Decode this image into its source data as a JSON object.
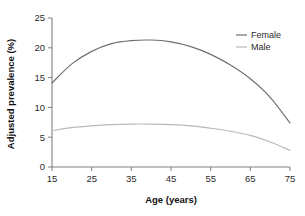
{
  "chart_data": {
    "type": "line",
    "title": "",
    "xlabel": "Age (years)",
    "ylabel": "Adjusted prevalence (%)",
    "xlim": [
      15,
      75
    ],
    "ylim": [
      0,
      25
    ],
    "xticks": [
      15,
      25,
      35,
      45,
      55,
      65,
      75
    ],
    "yticks": [
      0,
      5,
      10,
      15,
      20,
      25
    ],
    "xtick_labels": [
      "15",
      "25",
      "35",
      "45",
      "55",
      "65",
      "75"
    ],
    "ytick_labels": [
      "0",
      "5",
      "10",
      "15",
      "20",
      "25"
    ],
    "grid": false,
    "legend_position": "top-right",
    "x": [
      15,
      20,
      25,
      30,
      35,
      40,
      45,
      50,
      55,
      60,
      65,
      70,
      75
    ],
    "series": [
      {
        "name": "Female",
        "color": "#6e6e6e",
        "values": [
          14.1,
          17.3,
          19.4,
          20.7,
          21.2,
          21.3,
          21.0,
          20.2,
          18.9,
          17.1,
          14.8,
          11.7,
          7.4
        ]
      },
      {
        "name": "Male",
        "color": "#b9b9b9",
        "values": [
          6.1,
          6.6,
          6.9,
          7.1,
          7.2,
          7.2,
          7.1,
          6.9,
          6.5,
          6.0,
          5.3,
          4.2,
          2.8
        ]
      }
    ]
  },
  "legend": {
    "entries": [
      {
        "label": "Female",
        "color": "#6e6e6e"
      },
      {
        "label": "Male",
        "color": "#b9b9b9"
      }
    ]
  },
  "axes": {
    "x_title": "Age (years)",
    "y_title": "Adjusted prevalence (%)",
    "axis_color": "#808080"
  }
}
